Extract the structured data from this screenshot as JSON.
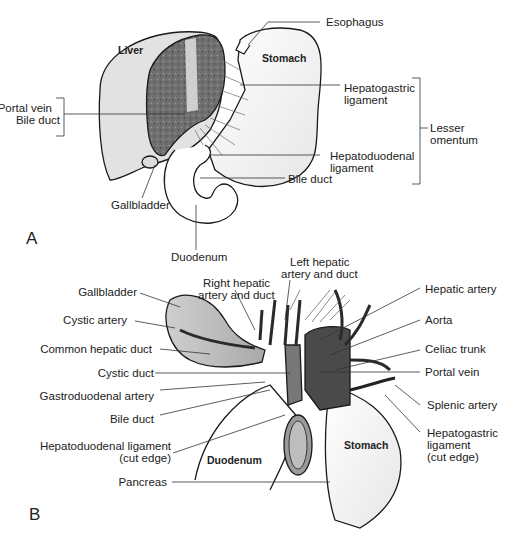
{
  "panel_a": {
    "letter": "A",
    "organs": {
      "liver": "Liver",
      "stomach": "Stomach"
    },
    "labels": {
      "esophagus": "Esophagus",
      "hepatogastric_1": "Hepatogastric",
      "hepatogastric_2": "ligament",
      "lesser_1": "Lesser",
      "lesser_2": "omentum",
      "hepatoduodenal_1": "Hepatoduodenal",
      "hepatoduodenal_2": "ligament",
      "bile_duct": "Bile duct",
      "portal_vein": "Portal vein",
      "bile_duct_left": "Bile duct",
      "gallbladder": "Gallbladder",
      "duodenum": "Duodenum"
    }
  },
  "panel_b": {
    "letter": "B",
    "organs": {
      "duodenum": "Duodenum",
      "stomach": "Stomach"
    },
    "labels": {
      "left_hepatic_1": "Left hepatic",
      "left_hepatic_2": "artery and duct",
      "right_hepatic_1": "Right hepatic",
      "right_hepatic_2": "artery and duct",
      "gallbladder": "Gallbladder",
      "cystic_artery": "Cystic artery",
      "common_hepatic_duct": "Common hepatic duct",
      "cystic_duct": "Cystic duct",
      "gastroduodenal_artery": "Gastroduodenal artery",
      "bile_duct": "Bile duct",
      "hepatoduodenal_1": "Hepatoduodenal ligament",
      "hepatoduodenal_2": "(cut edge)",
      "pancreas": "Pancreas",
      "hepatic_artery": "Hepatic artery",
      "aorta": "Aorta",
      "celiac_trunk": "Celiac trunk",
      "portal_vein": "Portal vein",
      "splenic_artery": "Splenic artery",
      "hepatogastric_1": "Hepatogastric",
      "hepatogastric_2": "ligament",
      "hepatogastric_3": "(cut edge)"
    }
  }
}
